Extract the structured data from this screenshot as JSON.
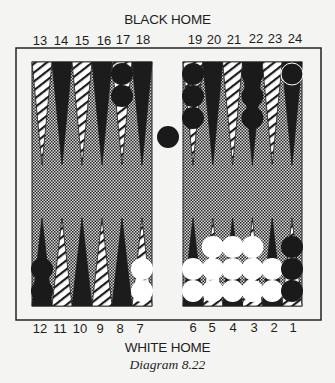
{
  "labels": {
    "top_home": "BLACK HOME",
    "bottom_home": "WHITE HOME",
    "caption": "Diagram 8.22"
  },
  "top_point_numbers": [
    "13",
    "14",
    "15",
    "16",
    "17",
    "18",
    "19",
    "20",
    "21",
    "22",
    "23",
    "24"
  ],
  "bottom_point_numbers": [
    "12",
    "11",
    "10",
    "9",
    "8",
    "7",
    "6",
    "5",
    "4",
    "3",
    "2",
    "1"
  ],
  "colors": {
    "dark_point": "#1c1c1c",
    "light_point": "#ffffff",
    "hatch_line": "#1c1c1c",
    "field_dot": "#2a2a2a",
    "field_bg": "#d9d9d9",
    "frame": "#222222",
    "black_checker": "#1a1a1a",
    "white_checker": "#ffffff"
  },
  "board": {
    "point_style": {
      "odd": "hatched",
      "even": "solid-dark"
    },
    "bar": {
      "black": 1,
      "white": 0
    }
  },
  "position": [
    {
      "point": 24,
      "color": "black",
      "count": 1
    },
    {
      "point": 22,
      "color": "black",
      "count": 3
    },
    {
      "point": 19,
      "color": "black",
      "count": 3
    },
    {
      "point": 17,
      "color": "black",
      "count": 2
    },
    {
      "point": 12,
      "color": "black",
      "count": 2
    },
    {
      "point": 7,
      "color": "white",
      "count": 2
    },
    {
      "point": 6,
      "color": "white",
      "count": 2
    },
    {
      "point": 5,
      "color": "white",
      "count": 3
    },
    {
      "point": 4,
      "color": "white",
      "count": 3
    },
    {
      "point": 3,
      "color": "white",
      "count": 3
    },
    {
      "point": 2,
      "color": "white",
      "count": 2
    },
    {
      "point": 1,
      "color": "black",
      "count": 3
    }
  ]
}
